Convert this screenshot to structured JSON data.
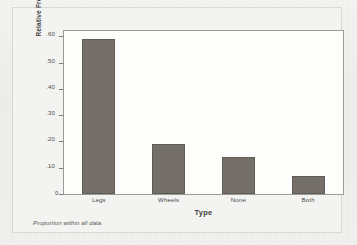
{
  "chart_data": {
    "type": "bar",
    "title": "",
    "subtitle": "",
    "categories": [
      "Legs",
      "Wheels",
      "None",
      "Both"
    ],
    "values": [
      0.59,
      0.19,
      0.14,
      0.07
    ],
    "series": [
      {
        "name": "Relative Frequency",
        "values": [
          0.59,
          0.19,
          0.14,
          0.07
        ]
      }
    ],
    "xlabel": "Type",
    "ylabel": "Relative Frequency",
    "ylim": [
      0,
      0.62
    ],
    "xlim": [
      0,
      4
    ],
    "y_ticks": [
      0,
      0.1,
      0.2,
      0.3,
      0.4,
      0.5,
      0.6
    ],
    "y_tick_labels": [
      "0",
      ".10",
      ".20",
      ".30",
      ".40",
      ".50",
      ".60"
    ],
    "x_tick_labels": [
      "Legs",
      "Wheels",
      "None",
      "Both"
    ],
    "grid": false,
    "legend": null,
    "legend_position": "none",
    "annotations": [
      "Proportion within all data."
    ],
    "bar_color": "#747069",
    "bar_edge_color": "#5f5b55",
    "plot_background": "#fdfdfc",
    "frame_color": "#9b9b97",
    "page_background": "#f2f2f0"
  },
  "figure": {
    "footnote": "Proportion within all data.",
    "y_axis_title": "Relative Frequency",
    "x_axis_title": "Type",
    "zero_label": "0"
  }
}
